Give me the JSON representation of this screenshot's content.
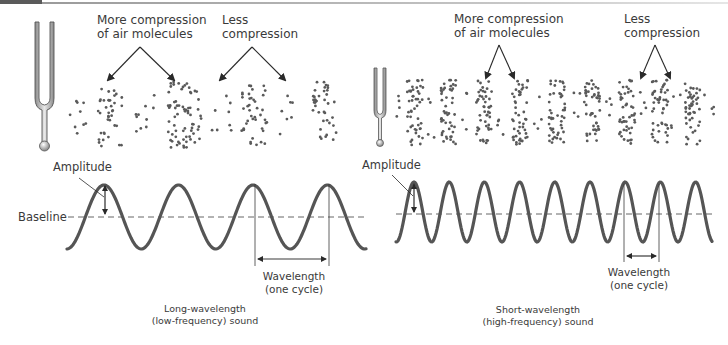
{
  "figure": {
    "left_panel": {
      "more_compression_label": [
        "More compression",
        "of air molecules"
      ],
      "less_compression_label": [
        "Less",
        "compression"
      ],
      "amplitude_label": "Amplitude",
      "baseline_label": "Baseline",
      "wavelength_label": [
        "Wavelength",
        "(one cycle)"
      ],
      "caption": [
        "Long-wavelength",
        "(low-frequency) sound"
      ]
    },
    "right_panel": {
      "more_compression_label": [
        "More compression",
        "of air molecules"
      ],
      "less_compression_label": [
        "Less",
        "compression"
      ],
      "amplitude_label": "Amplitude",
      "wavelength_label": [
        "Wavelength",
        "(one cycle)"
      ],
      "caption": [
        "Short-wavelength",
        "(high-frequency) sound"
      ]
    },
    "colors": {
      "wave": "#555555",
      "dots": "#5a5a5a",
      "text": "#3a3a3a",
      "baseline": "#666666"
    }
  }
}
